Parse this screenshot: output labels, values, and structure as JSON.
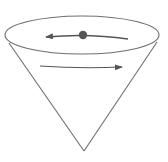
{
  "diagram": {
    "title": "Ball circling inside a cone",
    "colors": {
      "background": "#ffffff",
      "outline": "#6e6e6e",
      "arrow": "#555555",
      "ball": "#555555"
    },
    "elements": {
      "cone": "cone",
      "rim": "rim-ellipse",
      "ball": "ball",
      "upper_arrow": "arrow pointing left",
      "lower_arrow": "arrow pointing right"
    }
  }
}
